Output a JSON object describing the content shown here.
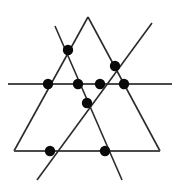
{
  "figure": {
    "canvas": {
      "width": 179,
      "height": 187
    },
    "background_color": "#ffffff",
    "line_color": "#2b2b2b",
    "horizontal_line_color": "#4a4a4a",
    "point_color": "#0a0a0a",
    "point_radius": 5.2,
    "line_width": 1.6,
    "counts": {
      "lines_label": "6 lines",
      "points_label": "9 points"
    },
    "lines": [
      {
        "name": "large-triangle-left-side",
        "description": "Left side of the large outer triangle, from apex down-left to bottom-left vertex",
        "x1": 88,
        "y1": 17,
        "x2": 14,
        "y2": 151
      },
      {
        "name": "large-triangle-right-side",
        "description": "Right side of the large outer triangle, from apex down-right to bottom-right vertex",
        "x1": 88,
        "y1": 17,
        "x2": 160,
        "y2": 151
      },
      {
        "name": "large-triangle-base",
        "description": "Base of the large outer triangle, horizontal lower edge",
        "x1": 14,
        "y1": 151,
        "x2": 160,
        "y2": 151
      },
      {
        "name": "horizontal-transversal",
        "description": "Long horizontal line crossing the whole figure, extending past both triangle sides",
        "x1": 8,
        "y1": 84,
        "x2": 172,
        "y2": 84
      },
      {
        "name": "diagonal-down-right",
        "description": "Diagonal running from upper-left down to lower-right, extending beyond the triangle at both ends",
        "x1": 55,
        "y1": 26,
        "x2": 122,
        "y2": 180
      },
      {
        "name": "diagonal-down-left",
        "description": "Diagonal running from upper-right down to lower-left, extending beyond the triangle at both ends",
        "x1": 152,
        "y1": 23,
        "x2": 37,
        "y2": 180
      }
    ],
    "points": [
      {
        "name": "point-upper-left",
        "x": 68,
        "y": 50,
        "description": "Intersection of the large triangle left side and the down-right diagonal"
      },
      {
        "name": "point-upper-right",
        "x": 115,
        "y": 66,
        "description": "Intersection of the large triangle right side and the down-left diagonal"
      },
      {
        "name": "point-horizontal-1",
        "x": 48,
        "y": 84,
        "description": "Intersection of the horizontal transversal and the large triangle left side"
      },
      {
        "name": "point-horizontal-2",
        "x": 78,
        "y": 84,
        "description": "Intersection of the horizontal transversal and the down-right diagonal"
      },
      {
        "name": "point-horizontal-3",
        "x": 100,
        "y": 84,
        "description": "Intersection of the horizontal transversal and the down-left diagonal"
      },
      {
        "name": "point-horizontal-4",
        "x": 124,
        "y": 84,
        "description": "Intersection of the horizontal transversal and the large triangle right side"
      },
      {
        "name": "point-center",
        "x": 87,
        "y": 103,
        "description": "Central crossing point of the two diagonals, below the horizontal line"
      },
      {
        "name": "point-bottom-left",
        "x": 50,
        "y": 151,
        "description": "Intersection of the triangle base and the down-left diagonal"
      },
      {
        "name": "point-bottom-right",
        "x": 105,
        "y": 151,
        "description": "Intersection of the triangle base and the down-right diagonal"
      }
    ]
  }
}
